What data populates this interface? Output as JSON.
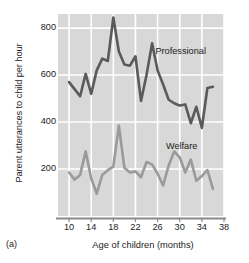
{
  "figure": {
    "panel_label": "(a)",
    "xlabel": "Age of children (months)",
    "ylabel": "Parent utterances to child per hour",
    "plot_bg_color": "#d8d8d8",
    "grid_color": "#ffffff",
    "axis_color": "#8a8a8a"
  },
  "annotations": {
    "professional": "Professional",
    "welfare": "Welfare"
  },
  "chart_data": {
    "type": "line",
    "title": "",
    "xlabel": "Age of children (months)",
    "ylabel": "Parent utterances to child per hour",
    "xlim": [
      8,
      38
    ],
    "ylim": [
      0,
      860
    ],
    "xticks": [
      10,
      14,
      18,
      22,
      26,
      30,
      34,
      38
    ],
    "yticks": [
      200,
      400,
      600,
      800
    ],
    "grid": true,
    "legend_position": "inline-annotations",
    "x": [
      10,
      11,
      12,
      13,
      14,
      15,
      16,
      17,
      18,
      19,
      20,
      21,
      22,
      23,
      24,
      25,
      26,
      27,
      28,
      29,
      30,
      31,
      32,
      33,
      34,
      35,
      36
    ],
    "series": [
      {
        "name": "Professional",
        "color": "#5a5a5a",
        "label_x": 25.6,
        "label_y": 700,
        "values": [
          570,
          540,
          510,
          605,
          520,
          620,
          670,
          660,
          845,
          700,
          645,
          640,
          680,
          490,
          600,
          735,
          620,
          560,
          495,
          480,
          470,
          475,
          395,
          465,
          375,
          545,
          550
        ]
      },
      {
        "name": "Welfare",
        "color": "#9a9a9a",
        "label_x": 27.5,
        "label_y": 295,
        "values": [
          185,
          155,
          175,
          275,
          160,
          95,
          175,
          195,
          210,
          385,
          205,
          185,
          190,
          165,
          230,
          220,
          180,
          130,
          215,
          275,
          250,
          185,
          240,
          150,
          170,
          195,
          115
        ]
      }
    ]
  }
}
